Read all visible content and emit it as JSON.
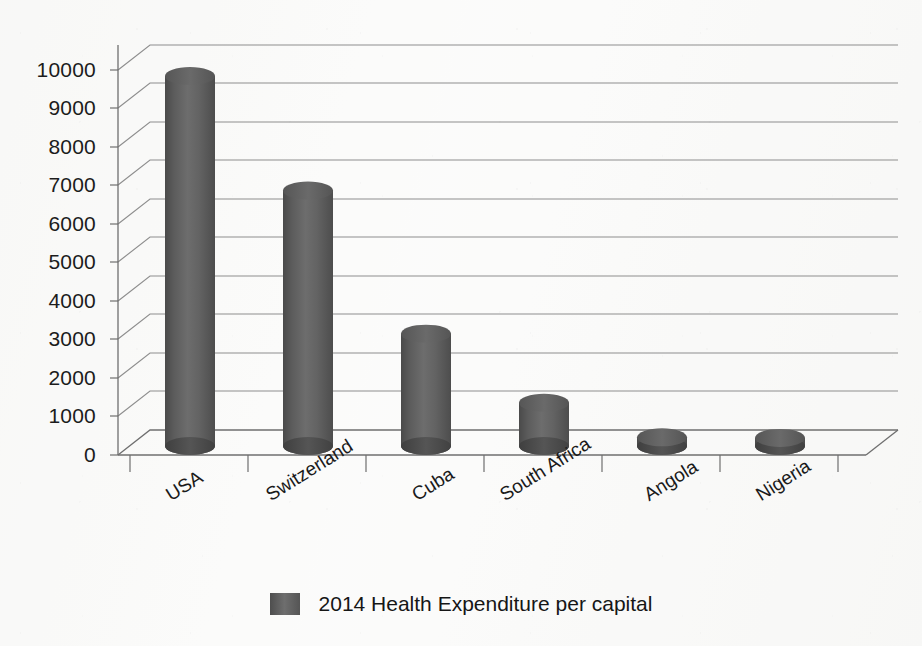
{
  "chart_data": {
    "type": "bar",
    "title": "",
    "subtitle": "",
    "xlabel": "",
    "ylabel": "",
    "categories": [
      "USA",
      "Switzerland",
      "Cuba",
      "South Africa",
      "Angola",
      "Nigeria"
    ],
    "series": [
      {
        "name": "2014 Health Expenditure per capital",
        "values": [
          9850,
          6800,
          2990,
          1150,
          230,
          215
        ]
      }
    ],
    "values": [
      9850,
      6800,
      2990,
      1150,
      230,
      215
    ],
    "ylim": [
      0,
      10000
    ],
    "ytick_step": 1000,
    "ytick_labels": [
      "0",
      "1000",
      "2000",
      "3000",
      "4000",
      "5000",
      "6000",
      "7000",
      "8000",
      "9000",
      "10000"
    ],
    "grid": true,
    "grid_axis": "y",
    "legend_position": "bottom",
    "style": "3d-cylinder",
    "bar_color": "#5f5f5f",
    "grid_color": "#8c8c8c",
    "axis_color": "#6e6e6e",
    "background_color": "#fbfbfa"
  },
  "legend": {
    "entries": [
      {
        "label": "2014 Health Expenditure per capital",
        "color": "#5f5f5f"
      }
    ]
  },
  "axes": {
    "y": {
      "ticks": [
        "10000",
        "9000",
        "8000",
        "7000",
        "6000",
        "5000",
        "4000",
        "3000",
        "2000",
        "1000",
        "0"
      ]
    },
    "x": {
      "ticks": [
        "USA",
        "Switzerland",
        "Cuba",
        "South Africa",
        "Angola",
        "Nigeria"
      ]
    }
  }
}
